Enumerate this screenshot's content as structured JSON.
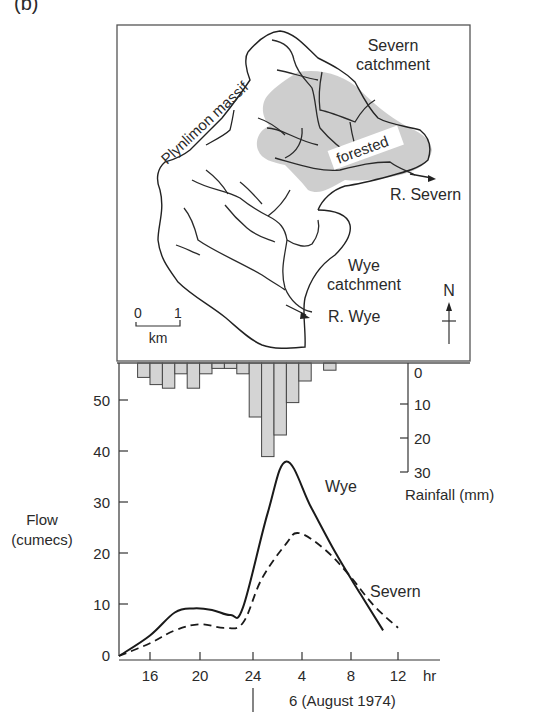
{
  "panel_label": "(b)",
  "map": {
    "labels": {
      "severn_catchment_1": "Severn",
      "severn_catchment_2": "catchment",
      "plynlimon": "Plynlimon massif",
      "forested": "forested",
      "r_severn": "R. Severn",
      "wye_catchment_1": "Wye",
      "wye_catchment_2": "catchment",
      "r_wye": "R. Wye",
      "north": "N",
      "scale_0": "0",
      "scale_1": "1",
      "scale_unit": "km"
    }
  },
  "chart": {
    "flow_label_1": "Flow",
    "flow_label_2": "(cumecs)",
    "rain_label": "Rainfall (mm)",
    "x_unit": "hr",
    "date_label": "6 (August 1974)",
    "series_labels": {
      "wye": "Wye",
      "severn": "Severn"
    },
    "colors": {
      "line": "#1a1a1a",
      "bar_fill": "#d4d4d4",
      "forest_fill": "#c8c8c8",
      "axis": "#333333"
    }
  },
  "chart_data": {
    "type": "line",
    "xlabel": "hr",
    "x_ticks": [
      "16",
      "20",
      "24",
      "4",
      "8",
      "12"
    ],
    "x_hours_elapsed": [
      16,
      20,
      24,
      28,
      32,
      36
    ],
    "ylabel": "Flow (cumecs)",
    "y_ticks": [
      0,
      10,
      20,
      30,
      40,
      50
    ],
    "ylim": [
      0,
      55
    ],
    "series": [
      {
        "name": "Wye",
        "style": "solid",
        "x": [
          13.5,
          16,
          18,
          19.5,
          21,
          22.5,
          23.5,
          25.5,
          27,
          29,
          31,
          33,
          34.8
        ],
        "values": [
          0,
          4,
          8.5,
          9.3,
          9,
          8,
          9.5,
          28,
          38,
          29,
          20,
          12,
          5
        ]
      },
      {
        "name": "Severn",
        "style": "dashed",
        "x": [
          13.5,
          16,
          18,
          20,
          22,
          23.5,
          25,
          27,
          28,
          30,
          32,
          34,
          36
        ],
        "values": [
          0,
          2.5,
          5,
          6.2,
          5.5,
          6.5,
          15,
          22,
          24,
          21,
          16,
          10,
          5.5
        ]
      }
    ],
    "rainfall": {
      "ylabel": "Rainfall (mm)",
      "y_ticks": [
        0,
        10,
        20,
        30
      ],
      "inverted": true,
      "bar_width_hr": 1,
      "x_start_hr": [
        15,
        16,
        17,
        18,
        19,
        20,
        21,
        22,
        23,
        24,
        25,
        26,
        27,
        28,
        30
      ],
      "values_mm": [
        4,
        6,
        7,
        3,
        7,
        3,
        1.5,
        1.5,
        3,
        15,
        26,
        20,
        11,
        5,
        2
      ]
    }
  }
}
